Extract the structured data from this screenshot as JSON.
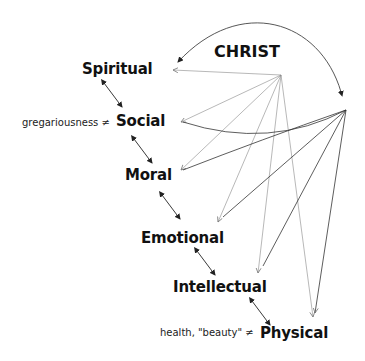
{
  "diagram": {
    "center_label": "CHRIST",
    "dimensions": [
      {
        "id": "spiritual",
        "label": "Spiritual",
        "note": ""
      },
      {
        "id": "social",
        "label": "Social",
        "note": "gregariousness ≠"
      },
      {
        "id": "moral",
        "label": "Moral",
        "note": ""
      },
      {
        "id": "emotional",
        "label": "Emotional",
        "note": ""
      },
      {
        "id": "intellectual",
        "label": "Intellectual",
        "note": ""
      },
      {
        "id": "physical",
        "label": "Physical",
        "note": "health, \"beauty\" ≠"
      }
    ],
    "connections": {
      "christ_to": [
        "spiritual",
        "social",
        "moral",
        "emotional",
        "intellectual",
        "physical"
      ],
      "hub_to": [
        "social",
        "moral",
        "emotional",
        "intellectual",
        "physical"
      ],
      "arc": "spiritual <-> hub",
      "chain": [
        "spiritual-social",
        "social-moral",
        "moral-emotional",
        "emotional-intellectual",
        "intellectual-physical"
      ]
    },
    "colors": {
      "line_light": "#777777",
      "line_dark": "#333333",
      "text": "#111111"
    }
  }
}
